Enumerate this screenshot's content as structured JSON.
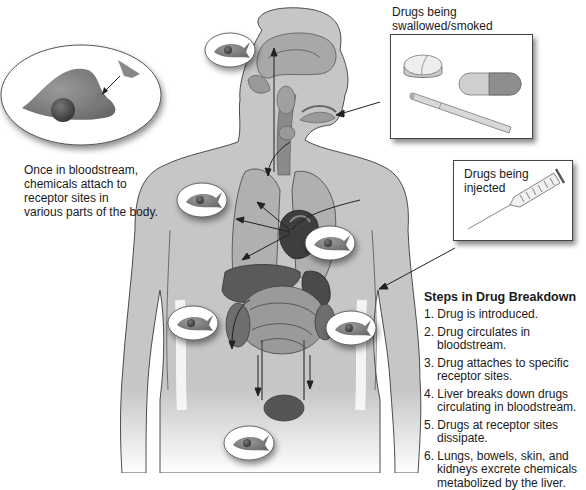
{
  "diagram": {
    "type": "anatomical-illustration"
  },
  "callouts": {
    "receptor": {
      "text_lines": [
        "Once in bloodstream,",
        "chemicals attach to",
        "receptor sites in",
        "various parts of the body."
      ]
    },
    "swallowed": {
      "text_lines": [
        "Drugs being",
        "swallowed/smoked"
      ],
      "items": [
        "pill-icon",
        "capsule-icon",
        "cigarette-icon"
      ]
    },
    "injected": {
      "text_lines": [
        "Drugs being",
        "injected"
      ],
      "items": [
        "syringe-icon"
      ]
    }
  },
  "steps": {
    "title": "Steps in Drug Breakdown",
    "items": [
      "1. Drug is introduced.",
      "2. Drug circulates in bloodstream.",
      "3. Drug attaches to specific receptor sites.",
      "4. Liver breaks down drugs circulating in bloodstream.",
      "5. Drugs at receptor sites dissipate.",
      "6. Lungs, bowels, skin, and kidneys excrete chemicals metabolized by the liver."
    ]
  },
  "receptor_sites": [
    {
      "location": "head",
      "x": 230,
      "y": 50
    },
    {
      "location": "shoulder",
      "x": 202,
      "y": 200
    },
    {
      "location": "chest-right",
      "x": 330,
      "y": 243
    },
    {
      "location": "abdomen-left",
      "x": 193,
      "y": 323
    },
    {
      "location": "abdomen-right",
      "x": 351,
      "y": 328
    },
    {
      "location": "pelvis",
      "x": 249,
      "y": 443
    }
  ],
  "colors": {
    "skin": "#c9c9c9",
    "outline": "#3a3a3a",
    "organ_dark": "#4a4a4a",
    "organ_mid": "#8a8a8a",
    "text": "#1a1a1a"
  }
}
